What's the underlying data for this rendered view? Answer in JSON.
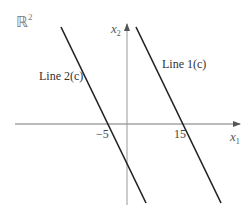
{
  "space_label": {
    "base": "ℝ",
    "exponent": "2"
  },
  "axes": {
    "x": {
      "symbol": "x",
      "subscript": "1"
    },
    "y": {
      "symbol": "x",
      "subscript": "2"
    }
  },
  "lines": [
    {
      "label": "Line 1(c)",
      "x_intercept": "15"
    },
    {
      "label": "Line 2(c)",
      "x_intercept": "−5"
    }
  ],
  "ticks": {
    "neg5": "−5",
    "pos15": "15"
  },
  "colors": {
    "axis": "#777777",
    "line": "#222222",
    "text": "#444444"
  }
}
